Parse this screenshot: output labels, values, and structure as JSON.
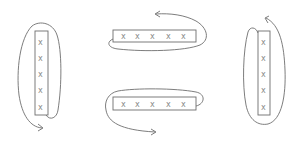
{
  "diagram": {
    "colors": {
      "stroke": "#6e6e6e",
      "mark": "#8a8a8a",
      "background": "#ffffff"
    },
    "figures": [
      {
        "id": "left-vertical",
        "orientation": "vertical",
        "marks": [
          "x",
          "x",
          "x",
          "x",
          "x"
        ],
        "arrow": "clockwise-to-bottom"
      },
      {
        "id": "top-horizontal",
        "orientation": "horizontal",
        "marks": [
          "x",
          "x",
          "x",
          "x",
          "x"
        ],
        "arrow": "counterclockwise-to-top"
      },
      {
        "id": "bottom-horizontal",
        "orientation": "horizontal",
        "marks": [
          "x",
          "x",
          "x",
          "x",
          "x"
        ],
        "arrow": "counterclockwise-to-bottom"
      },
      {
        "id": "right-vertical",
        "orientation": "vertical",
        "marks": [
          "x",
          "x",
          "x",
          "x",
          "x"
        ],
        "arrow": "clockwise-to-top"
      }
    ]
  }
}
